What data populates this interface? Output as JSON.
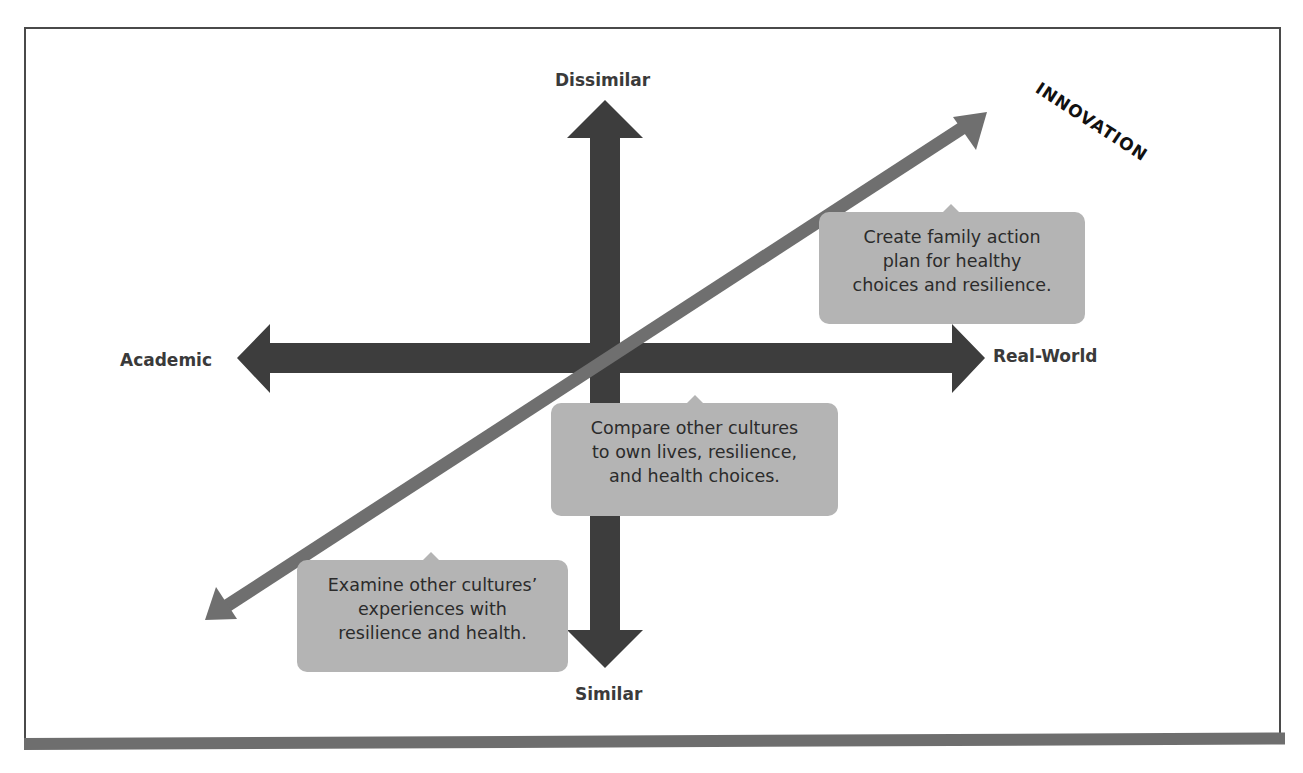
{
  "caption_partial": "Figure ... (cut off)",
  "diagram": {
    "type": "quadrant-axes",
    "colors": {
      "axis_arrows": "#3d3d3d",
      "innovation_arrow": "#6f6f6f",
      "callout_fill": "#b4b4b4",
      "frame": "#4a4a4a"
    },
    "axes": {
      "vertical": {
        "top_label": "Dissimilar",
        "bottom_label": "Similar"
      },
      "horizontal": {
        "left_label": "Academic",
        "right_label": "Real-World"
      }
    },
    "diagonal": {
      "label": "INNOVATION"
    },
    "callouts": [
      {
        "lines": [
          "Create family action",
          "plan for healthy",
          "choices and resilience."
        ]
      },
      {
        "lines": [
          "Compare other cultures",
          "to own lives, resilience,",
          "and health choices."
        ]
      },
      {
        "lines": [
          "Examine other cultures’",
          "experiences with",
          "resilience and health."
        ]
      }
    ]
  }
}
